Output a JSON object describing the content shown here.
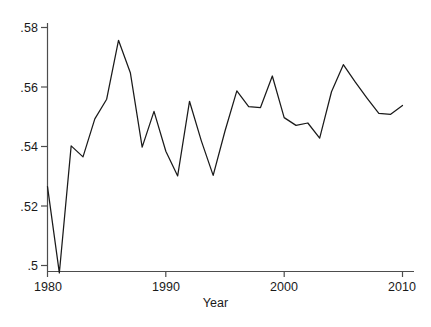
{
  "chart_data": {
    "type": "line",
    "title": "",
    "subtitle": "",
    "xlabel": "Year",
    "ylabel": "",
    "xlim": [
      1979.3,
      2010.6
    ],
    "ylim": [
      0.4955,
      0.5805
    ],
    "grid": false,
    "legend": null,
    "line_color": "#1a1a1a",
    "background_color": "#ffffff",
    "axis_color": "#4d4d4d",
    "x": [
      1980,
      1981,
      1982,
      1983,
      1984,
      1985,
      1986,
      1987,
      1988,
      1989,
      1990,
      1991,
      1992,
      1993,
      1994,
      1995,
      1996,
      1997,
      1998,
      1999,
      2000,
      2001,
      2002,
      2003,
      2004,
      2005,
      2006,
      2007,
      2008,
      2009,
      2010
    ],
    "values": [
      0.5265,
      0.4975,
      0.5402,
      0.5365,
      0.5493,
      0.5559,
      0.5757,
      0.5648,
      0.5398,
      0.5518,
      0.5384,
      0.5301,
      0.5552,
      0.5419,
      0.5303,
      0.5452,
      0.5587,
      0.5534,
      0.5531,
      0.5637,
      0.5497,
      0.5471,
      0.5479,
      0.5428,
      0.5584,
      0.5675,
      0.5617,
      0.5563,
      0.5511,
      0.5508,
      0.5538
    ],
    "xticks": [
      1980,
      1990,
      2000,
      2010
    ],
    "xtick_labels": [
      "1980",
      "1990",
      "2000",
      "2010"
    ],
    "yticks": [
      0.5,
      0.52,
      0.54,
      0.56,
      0.58
    ],
    "ytick_labels": [
      ".5",
      ".52",
      ".54",
      ".56",
      ".58"
    ]
  },
  "axis": {
    "x_title": "Year"
  }
}
